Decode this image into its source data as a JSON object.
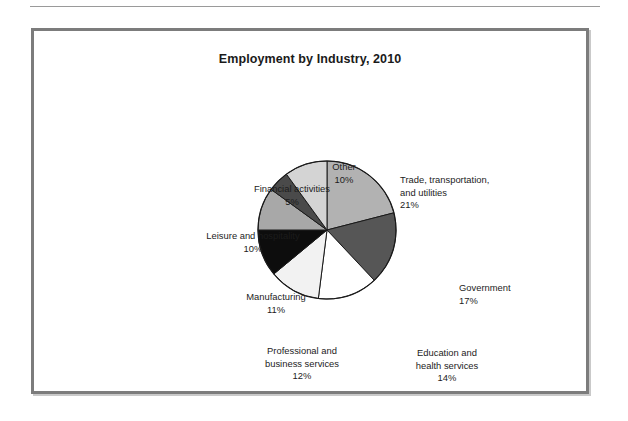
{
  "chart_data": {
    "type": "pie",
    "title": "Employment by Industry, 2010",
    "xlabel": "",
    "ylabel": "",
    "legend_position": "none",
    "labels_inline": true,
    "start_angle_deg": 0,
    "direction": "clockwise",
    "categories": [
      "Trade, transportation, and utilities",
      "Government",
      "Education and health services",
      "Professional and business services",
      "Manufacturing",
      "Leisure and hospitality",
      "Financial activities",
      "Other"
    ],
    "values": [
      21,
      17,
      14,
      12,
      11,
      10,
      5,
      10
    ],
    "units": "percent",
    "slices": [
      {
        "name": "Trade, transportation, and utilities",
        "line1": "Trade, transportation,",
        "line2": "and utilities",
        "percent_label": "21%",
        "value": 21,
        "color": "#b2b2b2"
      },
      {
        "name": "Government",
        "line1": "Government",
        "line2": "",
        "percent_label": "17%",
        "value": 17,
        "color": "#565656"
      },
      {
        "name": "Education and health services",
        "line1": "Education and",
        "line2": "health services",
        "percent_label": "14%",
        "value": 14,
        "color": "#ffffff"
      },
      {
        "name": "Professional and business services",
        "line1": "Professional and",
        "line2": "business services",
        "percent_label": "12%",
        "value": 12,
        "color": "#f2f2f2"
      },
      {
        "name": "Manufacturing",
        "line1": "Manufacturing",
        "line2": "",
        "percent_label": "11%",
        "value": 11,
        "color": "#0d0d0d"
      },
      {
        "name": "Leisure and hospitality",
        "line1": "Leisure and hospitality",
        "line2": "",
        "percent_label": "10%",
        "value": 10,
        "color": "#a8a8a8"
      },
      {
        "name": "Financial activities",
        "line1": "Financial activities",
        "line2": "",
        "percent_label": "5%",
        "value": 5,
        "color": "#4a4a4a"
      },
      {
        "name": "Other",
        "line1": "Other",
        "line2": "",
        "percent_label": "10%",
        "value": 10,
        "color": "#d4d4d4"
      }
    ],
    "colors": {
      "outline": "#1a1a1a",
      "frame": "#7c7c7c",
      "frame_shadow": "#c9c9c9",
      "rule": "#9a9a9a",
      "text": "#1c1c1c",
      "background": "#ffffff"
    }
  }
}
